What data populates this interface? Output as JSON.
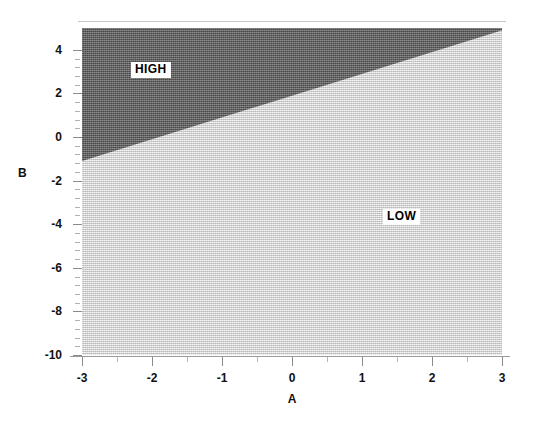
{
  "chart_data": {
    "type": "heatmap",
    "title": "",
    "subtitle": "",
    "xlabel": "A",
    "ylabel": "B",
    "xlim": [
      -3,
      3
    ],
    "ylim": [
      -10,
      5
    ],
    "grid": false,
    "legend_position": "in-plot-annotations",
    "x_ticks": [
      {
        "value": -3,
        "label": "-3"
      },
      {
        "value": -2,
        "label": "-2"
      },
      {
        "value": -1,
        "label": "-1"
      },
      {
        "value": 0,
        "label": "0"
      },
      {
        "value": 1,
        "label": "1"
      },
      {
        "value": 2,
        "label": "2"
      },
      {
        "value": 3,
        "label": "3"
      }
    ],
    "y_ticks": [
      {
        "value": 4,
        "label": "4"
      },
      {
        "value": 2,
        "label": "2"
      },
      {
        "value": 0,
        "label": "0"
      },
      {
        "value": -2,
        "label": "-2"
      },
      {
        "value": -4,
        "label": "-4"
      },
      {
        "value": -6,
        "label": "-6"
      },
      {
        "value": -8,
        "label": "-8"
      },
      {
        "value": -10,
        "label": "-10"
      }
    ],
    "regions": [
      {
        "name": "high-region",
        "label": "HIGH",
        "fill": "#6b6b6b",
        "description": "Dark shaded wedge occupying the upper-left of the plot, bounded below by a straight diagonal boundary.",
        "vertices": [
          [
            -3,
            5
          ],
          [
            3,
            5
          ],
          [
            3,
            4.9
          ],
          [
            -3,
            -1.1
          ]
        ]
      },
      {
        "name": "low-region",
        "label": "LOW",
        "fill": "#d1d1d1",
        "description": "Light shaded region filling the remainder of the plot below and right of the diagonal boundary.",
        "vertices": [
          [
            -3,
            -1.1
          ],
          [
            3,
            4.9
          ],
          [
            3,
            -10
          ],
          [
            -3,
            -10
          ]
        ]
      }
    ],
    "boundary_line": {
      "name": "decision-boundary",
      "description": "Straight line separating HIGH and LOW regions",
      "points": [
        [
          -3,
          -1.1
        ],
        [
          3,
          4.9
        ]
      ],
      "slope": 1.0,
      "intercept": 1.9
    },
    "annotations": [
      {
        "text": "HIGH",
        "x": -2.3,
        "y": 3.45,
        "boxed": true
      },
      {
        "text": "LOW",
        "x": 1.3,
        "y": -3.3,
        "boxed": true
      }
    ]
  },
  "axes": {
    "y_title": "B",
    "x_title": "A"
  },
  "labels": {
    "high": "HIGH",
    "low": "LOW"
  },
  "colors": {
    "high_fill": "#6b6b6b",
    "low_fill": "#d1d1d1",
    "axis": "#8a8a8a",
    "text": "#111111",
    "background": "#ffffff"
  }
}
